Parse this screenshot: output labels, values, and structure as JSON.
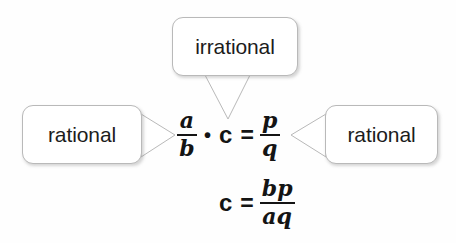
{
  "diagram": {
    "background_color": "#fefefe",
    "ink_color": "#141414",
    "border_color": "#b9b9b9"
  },
  "callouts": [
    {
      "id": "irrational",
      "label": "irrational",
      "points_to": "c",
      "tail_direction": "down"
    },
    {
      "id": "rational-left",
      "label": "rational",
      "points_to": "a/b",
      "tail_direction": "right"
    },
    {
      "id": "rational-right",
      "label": "rational",
      "points_to": "p/q",
      "tail_direction": "left"
    }
  ],
  "equations": [
    {
      "id": "main",
      "text": "a/b • c = p/q",
      "left_fraction": {
        "numerator": "a",
        "denominator": "b"
      },
      "multiply_symbol": "•",
      "variable": "c",
      "equals": "=",
      "right_fraction": {
        "numerator": "p",
        "denominator": "q"
      }
    },
    {
      "id": "solved",
      "text": "c = bp/aq",
      "variable": "c",
      "equals": "=",
      "fraction": {
        "numerator": "bp",
        "denominator": "aq"
      }
    }
  ]
}
